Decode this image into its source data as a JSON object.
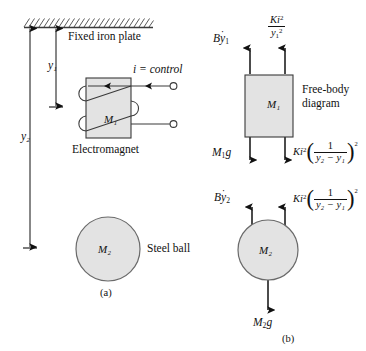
{
  "figure": {
    "title_a": "(a)",
    "title_b": "(b)",
    "colors": {
      "shape_fill": "#e3e3e3",
      "stroke": "#3a3a3a",
      "text": "#111111",
      "background": "#ffffff"
    }
  },
  "panel_a": {
    "caption": "(a)",
    "plate_label": "Fixed iron plate",
    "dimension_y1": "y₁",
    "dimension_y2": "y₂",
    "magnet_mass_label": "M₁",
    "magnet_label": "Electromagnet",
    "current_label": "i = control",
    "ball_mass_label": "M₂",
    "ball_label": "Steel ball"
  },
  "panel_b": {
    "caption": "(b)",
    "fbd_label_line1": "Free-body",
    "fbd_label_line2": "diagram",
    "magnet": {
      "mass_label": "M₁",
      "force_damping": "Bẏ₁",
      "force_damping_base": "B",
      "force_damping_var": "y",
      "force_damping_sub": "1",
      "force_magnet_num_K": "Ki",
      "force_magnet_num_sup": "2",
      "force_magnet_den_y": "y",
      "force_magnet_den_sub": "1",
      "force_magnet_den_sup": "2",
      "force_weight": "M₁g",
      "force_weight_base": "M",
      "force_weight_sub": "1",
      "force_weight_g": "g",
      "force_ball_K": "Ki",
      "force_ball_K_sup": "2",
      "force_ball_num": "1",
      "force_ball_den": "y₂ − y₁",
      "force_ball_outer_sup": "2"
    },
    "ball": {
      "mass_label": "M₂",
      "force_damping_base": "B",
      "force_damping_var": "y",
      "force_damping_sub": "2",
      "force_magnet_K": "Ki",
      "force_magnet_K_sup": "2",
      "force_magnet_num": "1",
      "force_magnet_den": "y₂ − y₁",
      "force_magnet_outer_sup": "2",
      "force_weight_base": "M",
      "force_weight_sub": "2",
      "force_weight_g": "g"
    }
  }
}
